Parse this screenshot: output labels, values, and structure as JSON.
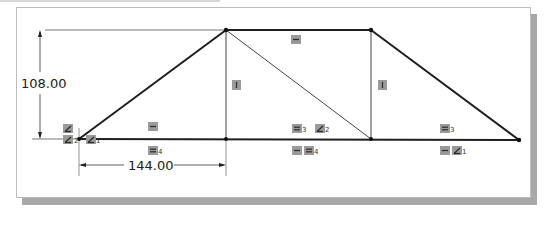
{
  "sketch": {
    "dimensions": {
      "vertical": {
        "value": "108.00"
      },
      "horizontal": {
        "value": "144.00"
      }
    },
    "vertices": [
      {
        "name": "bottom-left",
        "x": 79,
        "y": 139
      },
      {
        "name": "top-left",
        "x": 226,
        "y": 30
      },
      {
        "name": "top-right",
        "x": 371,
        "y": 30
      },
      {
        "name": "bottom-right",
        "x": 519,
        "y": 140
      },
      {
        "name": "bottom-mid-left",
        "x": 226,
        "y": 139
      },
      {
        "name": "bottom-mid-right",
        "x": 371,
        "y": 139
      }
    ],
    "relations": [
      {
        "id": "left-point-collinear",
        "glyph": "collinear",
        "sub": ""
      },
      {
        "id": "left-point-collinear-2",
        "glyph": "collinear",
        "sub": "2"
      },
      {
        "id": "left-point-collinear-1",
        "glyph": "collinear",
        "sub": "1"
      },
      {
        "id": "top-horizontal",
        "glyph": "horizontal",
        "sub": ""
      },
      {
        "id": "left-vertical",
        "glyph": "vertical",
        "sub": ""
      },
      {
        "id": "right-vertical",
        "glyph": "vertical",
        "sub": ""
      },
      {
        "id": "left-diag-horizontal",
        "glyph": "horizontal",
        "sub": ""
      },
      {
        "id": "left-bottom-equal-4",
        "glyph": "equal",
        "sub": "4"
      },
      {
        "id": "mid-equal-3",
        "glyph": "equal",
        "sub": "3"
      },
      {
        "id": "mid-collinear-2",
        "glyph": "collinear",
        "sub": "2"
      },
      {
        "id": "mid-bottom-horizontal",
        "glyph": "horizontal",
        "sub": ""
      },
      {
        "id": "mid-bottom-equal-4",
        "glyph": "equal",
        "sub": "4"
      },
      {
        "id": "right-equal-3",
        "glyph": "equal",
        "sub": "3"
      },
      {
        "id": "right-bottom-horizontal",
        "glyph": "horizontal",
        "sub": ""
      },
      {
        "id": "right-bottom-collinear-1",
        "glyph": "collinear",
        "sub": "1"
      }
    ]
  }
}
